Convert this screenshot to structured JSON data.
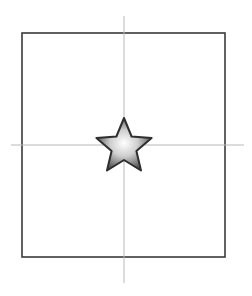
{
  "canvas": {
    "width": 252,
    "height": 296,
    "background": "#ffffff"
  },
  "frame": {
    "x": 22,
    "y": 33,
    "width": 203,
    "height": 224,
    "stroke": "#3a3a3a",
    "stroke_width": 1.6
  },
  "guides": {
    "vertical": {
      "x": 124,
      "y1": 16,
      "y2": 283,
      "color": "#b8b8b8"
    },
    "horizontal": {
      "y": 145,
      "x1": 11,
      "x2": 244,
      "color": "#b8b8b8"
    }
  },
  "star": {
    "center_x": 124,
    "center_y": 147,
    "outer_radius": 29,
    "inner_radius": 13,
    "fill_center": "#ffffff",
    "fill_edge": "#4a4a4a",
    "stroke": "#2e2e2e"
  }
}
